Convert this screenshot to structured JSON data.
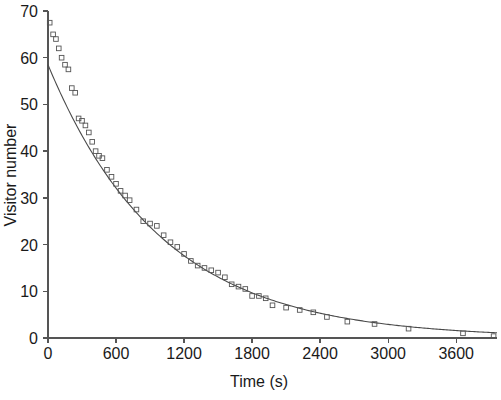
{
  "chart_data": {
    "type": "scatter",
    "title": "",
    "xlabel": "Time (s)",
    "ylabel": "Visitor number",
    "xlim": [
      0,
      3960
    ],
    "ylim": [
      0,
      70
    ],
    "xticks": [
      0,
      600,
      1200,
      1800,
      2400,
      3000,
      3600
    ],
    "xticklabels": [
      "0",
      "600",
      "1200",
      "1800",
      "2400",
      "3000",
      "3600"
    ],
    "yticks": [
      0,
      10,
      20,
      30,
      40,
      50,
      60,
      70
    ],
    "yticklabels": [
      "0",
      "10",
      "20",
      "30",
      "40",
      "50",
      "60",
      "70"
    ],
    "grid": false,
    "legend": null,
    "marker": "open-square",
    "series": [
      {
        "name": "Observed visitor number",
        "x": [
          15,
          45,
          70,
          95,
          120,
          150,
          180,
          210,
          240,
          270,
          300,
          330,
          360,
          390,
          420,
          450,
          480,
          520,
          560,
          600,
          640,
          680,
          720,
          780,
          840,
          900,
          960,
          1020,
          1080,
          1140,
          1200,
          1260,
          1320,
          1380,
          1440,
          1500,
          1560,
          1620,
          1680,
          1740,
          1800,
          1860,
          1920,
          1980,
          2100,
          2220,
          2340,
          2460,
          2640,
          2880,
          3180,
          3660,
          3930
        ],
        "y": [
          67.5,
          65.0,
          64.0,
          62.0,
          60.0,
          58.5,
          57.5,
          53.5,
          52.5,
          47.0,
          46.5,
          45.5,
          44.0,
          42.0,
          40.0,
          39.0,
          38.5,
          36.0,
          34.5,
          33.0,
          31.5,
          30.5,
          29.5,
          27.5,
          25.0,
          24.5,
          24.0,
          22.0,
          20.5,
          19.5,
          18.0,
          16.5,
          15.5,
          15.0,
          14.5,
          14.0,
          13.0,
          11.5,
          11.0,
          10.5,
          9.0,
          9.0,
          8.5,
          7.0,
          6.5,
          6.0,
          5.5,
          4.5,
          3.5,
          3.0,
          2.0,
          1.0,
          0.4
        ]
      },
      {
        "name": "Exponential fit",
        "type": "line",
        "fit": "exponential",
        "amplitude": 58.5,
        "decay_constant": 1000,
        "offset": 0.0
      }
    ]
  },
  "figure": {
    "background_color": "#ffffff",
    "axis_color": "#555555",
    "marker_color": "#555555",
    "curve_color": "#4a4a4a",
    "text_color": "#1a1a1a"
  }
}
